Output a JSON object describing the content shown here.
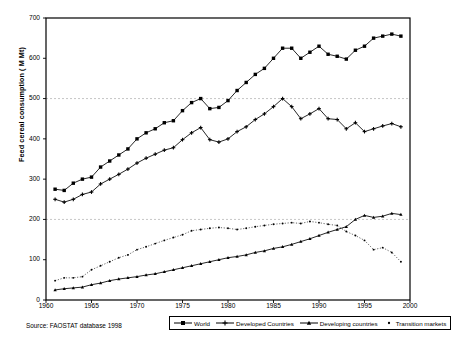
{
  "chart_data": {
    "type": "line",
    "title": "",
    "xlabel": "",
    "ylabel": "Feed cereal consumption ( M Mt)",
    "xlim": [
      1960,
      2000
    ],
    "ylim": [
      0,
      700
    ],
    "yticks": [
      0,
      100,
      200,
      300,
      400,
      500,
      600,
      700
    ],
    "xticks": [
      1960,
      1965,
      1970,
      1975,
      1980,
      1985,
      1990,
      1995,
      2000
    ],
    "gridlines_y": [
      200,
      500
    ],
    "grid": "dashed horizontal at 200 and 500 only",
    "legend_position": "bottom",
    "x": [
      1961,
      1962,
      1963,
      1964,
      1965,
      1966,
      1967,
      1968,
      1969,
      1970,
      1971,
      1972,
      1973,
      1974,
      1975,
      1976,
      1977,
      1978,
      1979,
      1980,
      1981,
      1982,
      1983,
      1984,
      1985,
      1986,
      1987,
      1988,
      1989,
      1990,
      1991,
      1992,
      1993,
      1994,
      1995,
      1996,
      1997,
      1998,
      1999
    ],
    "series": [
      {
        "name": "World",
        "marker": "square",
        "values": [
          275,
          272,
          290,
          300,
          305,
          330,
          345,
          360,
          375,
          400,
          415,
          425,
          440,
          445,
          470,
          490,
          500,
          475,
          478,
          495,
          520,
          540,
          560,
          575,
          600,
          625,
          625,
          600,
          615,
          630,
          610,
          605,
          598,
          620,
          630,
          650,
          655,
          660,
          655
        ]
      },
      {
        "name": "Developed Countries",
        "marker": "plus",
        "values": [
          250,
          243,
          250,
          262,
          268,
          288,
          300,
          312,
          325,
          340,
          352,
          362,
          372,
          378,
          398,
          415,
          428,
          398,
          392,
          400,
          418,
          430,
          448,
          462,
          480,
          500,
          480,
          450,
          462,
          475,
          450,
          448,
          425,
          440,
          418,
          425,
          432,
          438,
          430
        ]
      },
      {
        "name": "Developing countries",
        "marker": "triangle",
        "values": [
          25,
          28,
          30,
          32,
          38,
          42,
          48,
          52,
          55,
          58,
          62,
          65,
          70,
          75,
          80,
          85,
          90,
          95,
          100,
          105,
          108,
          112,
          118,
          122,
          128,
          132,
          138,
          145,
          152,
          160,
          168,
          175,
          182,
          200,
          210,
          205,
          208,
          215,
          212
        ]
      },
      {
        "name": "Transition markets",
        "marker": "dot",
        "values": [
          48,
          55,
          55,
          58,
          75,
          85,
          95,
          105,
          112,
          125,
          132,
          140,
          148,
          155,
          162,
          172,
          175,
          178,
          180,
          178,
          175,
          178,
          182,
          185,
          188,
          190,
          192,
          190,
          195,
          192,
          188,
          185,
          170,
          160,
          148,
          125,
          130,
          118,
          95
        ]
      }
    ]
  },
  "legend": {
    "items": [
      {
        "label": "World",
        "marker": "square"
      },
      {
        "label": "Developed Countries",
        "marker": "plus"
      },
      {
        "label": "Developing countries",
        "marker": "triangle"
      },
      {
        "label": "Transition markets",
        "marker": "dot"
      }
    ]
  },
  "source": {
    "text": "Source: FAOSTAT database 1998"
  },
  "colors": {
    "line": "#000000",
    "axis": "#000000",
    "grid": "#b8b8b8",
    "background": "#ffffff"
  }
}
